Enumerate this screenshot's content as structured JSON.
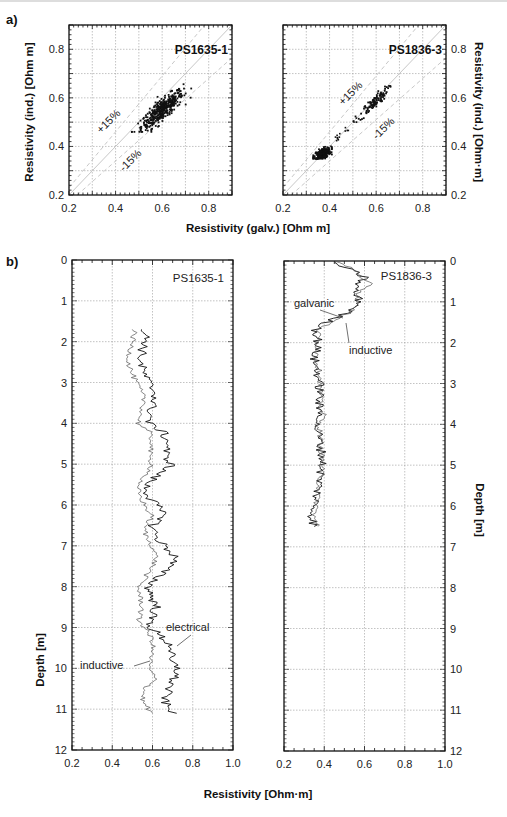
{
  "figure": {
    "panel_a_tag": "a)",
    "panel_b_tag": "b)"
  },
  "chart_data": [
    {
      "type": "scatter",
      "id": "scatter_PS1635_1",
      "title": "PS1635-1",
      "xlabel": "Resistivity (galv.) [Ohm m]",
      "ylabel": "Resistivity (ind.) [Ohm m]",
      "xlim": [
        0.2,
        0.9
      ],
      "ylim": [
        0.2,
        0.9
      ],
      "xticks": [
        "0.2",
        "0.4",
        "0.6",
        "0.8"
      ],
      "yticks": [
        "0.2",
        "0.4",
        "0.6",
        "0.8"
      ],
      "grid": true,
      "annotations": [
        "+15%",
        "-15%"
      ],
      "cluster": {
        "x_range": [
          0.47,
          0.8
        ],
        "y_range": [
          0.46,
          0.71
        ],
        "center": [
          0.6,
          0.55
        ]
      }
    },
    {
      "type": "scatter",
      "id": "scatter_PS1836_3",
      "title": "PS1836-3",
      "xlabel": "Resistivity (galv.) [Ohm m]",
      "ylabel": "Resistivity (ind.) [Ohm·m]",
      "xlim": [
        0.2,
        0.9
      ],
      "ylim": [
        0.2,
        0.9
      ],
      "xticks": [
        "0.2",
        "0.4",
        "0.6",
        "0.8"
      ],
      "yticks": [
        "0.2",
        "0.4",
        "0.6",
        "0.8"
      ],
      "grid": true,
      "annotations": [
        "+15%",
        "-15%"
      ],
      "clusters": [
        {
          "x_range": [
            0.33,
            0.41
          ],
          "y_range": [
            0.35,
            0.4
          ],
          "center": [
            0.37,
            0.37
          ]
        },
        {
          "x_range": [
            0.5,
            0.68
          ],
          "y_range": [
            0.5,
            0.66
          ],
          "center": [
            0.59,
            0.58
          ]
        }
      ]
    },
    {
      "type": "line",
      "id": "profile_PS1635_1",
      "title": "PS1635-1",
      "xlabel": "Resistivity [Ohm·m]",
      "ylabel": "Depth [m]",
      "xlim": [
        0.2,
        1.0
      ],
      "ylim": [
        0,
        12
      ],
      "xticks": [
        "0.2",
        "0.4",
        "0.6",
        "0.8",
        "1.0"
      ],
      "yticks": [
        "0",
        "1",
        "2",
        "3",
        "4",
        "5",
        "6",
        "7",
        "8",
        "9",
        "10",
        "11",
        "12"
      ],
      "grid": true,
      "series": [
        {
          "name": "electrical",
          "depth": [
            1.7,
            2.0,
            2.2,
            2.5,
            2.8,
            3.0,
            3.3,
            3.5,
            3.8,
            4.0,
            4.2,
            4.5,
            4.8,
            5.0,
            5.2,
            5.5,
            5.8,
            6.0,
            6.3,
            6.5,
            6.8,
            7.0,
            7.3,
            7.5,
            7.8,
            8.0,
            8.3,
            8.5,
            8.8,
            9.0,
            9.3,
            9.5,
            9.8,
            10.0,
            10.3,
            10.5,
            10.8,
            11.0,
            11.1
          ],
          "resistivity": [
            0.56,
            0.57,
            0.55,
            0.54,
            0.56,
            0.58,
            0.62,
            0.6,
            0.59,
            0.58,
            0.65,
            0.68,
            0.66,
            0.7,
            0.64,
            0.57,
            0.58,
            0.62,
            0.66,
            0.6,
            0.62,
            0.66,
            0.72,
            0.68,
            0.62,
            0.58,
            0.6,
            0.62,
            0.59,
            0.59,
            0.66,
            0.7,
            0.68,
            0.73,
            0.7,
            0.68,
            0.66,
            0.68,
            0.72
          ]
        },
        {
          "name": "inductive",
          "depth": [
            1.7,
            2.0,
            2.2,
            2.5,
            2.8,
            3.0,
            3.3,
            3.5,
            3.8,
            4.0,
            4.2,
            4.5,
            4.8,
            5.0,
            5.2,
            5.5,
            5.8,
            6.0,
            6.3,
            6.5,
            6.8,
            7.0,
            7.3,
            7.5,
            7.8,
            8.0,
            8.3,
            8.5,
            8.8,
            9.0,
            9.3,
            9.5,
            9.8,
            10.0,
            10.3,
            10.5,
            10.8,
            11.0,
            11.1
          ],
          "resistivity": [
            0.51,
            0.5,
            0.49,
            0.48,
            0.5,
            0.52,
            0.55,
            0.56,
            0.54,
            0.53,
            0.58,
            0.6,
            0.58,
            0.6,
            0.58,
            0.52,
            0.54,
            0.56,
            0.6,
            0.56,
            0.57,
            0.6,
            0.62,
            0.6,
            0.56,
            0.53,
            0.54,
            0.55,
            0.53,
            0.56,
            0.6,
            0.6,
            0.59,
            0.58,
            0.62,
            0.56,
            0.55,
            0.58,
            0.6
          ]
        }
      ],
      "annotations": [
        "electrical",
        "inductive"
      ]
    },
    {
      "type": "line",
      "id": "profile_PS1836_3",
      "title": "PS1836-3",
      "xlabel": "Resistivity [Ohm·m]",
      "ylabel": "Depth [m]",
      "xlim": [
        0.2,
        1.0
      ],
      "ylim": [
        0,
        12
      ],
      "xticks": [
        "0.2",
        "0.4",
        "0.6",
        "0.8",
        "1.0"
      ],
      "yticks": [
        "0",
        "1",
        "2",
        "3",
        "4",
        "5",
        "6",
        "7",
        "8",
        "9",
        "10",
        "11",
        "12"
      ],
      "grid": true,
      "series": [
        {
          "name": "galvanic",
          "depth": [
            0.0,
            0.2,
            0.4,
            0.6,
            0.8,
            1.0,
            1.2,
            1.4,
            1.6,
            1.7,
            2.0,
            2.4,
            2.8,
            3.2,
            3.6,
            3.8,
            4.0,
            4.2,
            4.5,
            4.8,
            5.0,
            5.3,
            5.6,
            6.0,
            6.3,
            6.5
          ],
          "resistivity": [
            0.43,
            0.52,
            0.6,
            0.56,
            0.55,
            0.58,
            0.54,
            0.45,
            0.38,
            0.36,
            0.37,
            0.35,
            0.37,
            0.38,
            0.37,
            0.39,
            0.36,
            0.37,
            0.38,
            0.39,
            0.39,
            0.38,
            0.37,
            0.35,
            0.34,
            0.35
          ]
        },
        {
          "name": "inductive",
          "depth": [
            0.0,
            0.2,
            0.4,
            0.55,
            0.8,
            1.0,
            1.2,
            1.4,
            1.6,
            1.7,
            2.0,
            2.4,
            2.8,
            3.2,
            3.6,
            3.8,
            4.0,
            4.2,
            4.5,
            4.8,
            5.0,
            5.3,
            5.6,
            6.0,
            6.3,
            6.5
          ],
          "resistivity": [
            0.45,
            0.55,
            0.58,
            0.65,
            0.56,
            0.57,
            0.55,
            0.47,
            0.4,
            0.37,
            0.37,
            0.36,
            0.38,
            0.38,
            0.38,
            0.4,
            0.37,
            0.38,
            0.38,
            0.39,
            0.39,
            0.38,
            0.37,
            0.36,
            0.35,
            0.37
          ]
        }
      ],
      "annotations": [
        "galvanic",
        "inductive"
      ]
    }
  ],
  "labels": {
    "a_xlabel": "Resistivity (galv.) [Ohm m]",
    "a_left_ylabel": "Resistivity (ind.) [Ohm m]",
    "a_right_ylabel": "Resistivity (ind.) [Ohm·m]",
    "b_xlabel": "Resistivity [Ohm·m]",
    "b_left_ylabel": "Depth [m]",
    "b_right_ylabel": "Depth [m]",
    "a_left_title": "PS1635-1",
    "a_right_title": "PS1836-3",
    "b_left_title": "PS1635-1",
    "b_right_title": "PS1836-3",
    "plus15": "+15%",
    "minus15": "-15%",
    "ann_electrical": "electrical",
    "ann_inductive_left": "inductive",
    "ann_galvanic": "galvanic",
    "ann_inductive_right": "inductive"
  }
}
